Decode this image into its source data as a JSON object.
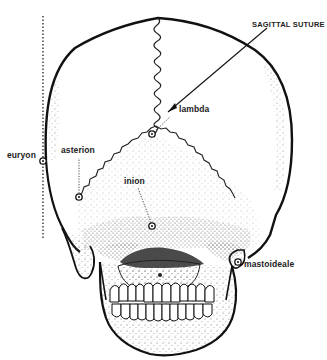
{
  "figure": {
    "colors": {
      "ink": "#1a1a1a",
      "stipple": "#555555",
      "background": "#ffffff"
    }
  },
  "labels": {
    "sagittal_suture": "SAGITTAL SUTURE",
    "lambda": "lambda",
    "euryon": "euryon",
    "asterion": "asterion",
    "inion": "inion",
    "mastoideale": "mastoideale"
  }
}
